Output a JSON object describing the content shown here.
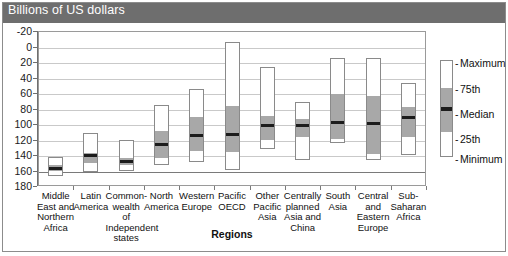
{
  "header": {
    "title": "Billions of US dollars"
  },
  "axis": {
    "y_ticks": [
      "180",
      "160",
      "140",
      "120",
      "100",
      "80",
      "60",
      "40",
      "20",
      "0",
      "-20"
    ],
    "x_title": "Regions"
  },
  "legend": {
    "items": [
      {
        "label": "Maximum",
        "dash": "-"
      },
      {
        "label": "75th",
        "dash": "-"
      },
      {
        "label": "Median",
        "dash": "-"
      },
      {
        "label": "25th",
        "dash": "-"
      },
      {
        "label": "Minimum",
        "dash": "-"
      }
    ]
  },
  "colors": {
    "title_band": "#6e6e6e",
    "iqr_fill": "#a8a8a8",
    "median": "#1c1c1c",
    "bar_outline": "#8a8a8a",
    "gridline": "#c9c9c9",
    "frame": "#8c8c8c"
  },
  "chart_data": {
    "type": "bar",
    "title": "Billions of US dollars",
    "xlabel": "Regions",
    "ylabel": "Billions of US dollars",
    "ylim": [
      -20,
      180
    ],
    "yticks": [
      -20,
      0,
      20,
      40,
      60,
      80,
      100,
      120,
      140,
      160,
      180
    ],
    "grid": true,
    "legend_position": "right",
    "categories": [
      "Middle East and Northern Africa",
      "Latin America",
      "Common-wealth of Independent states",
      "North America",
      "Western Europe",
      "Pacific OECD",
      "Other Pacific Asia",
      "Centrally planned Asia and China",
      "South Asia",
      "Central and Eastern Europe",
      "Sub-Saharan Africa"
    ],
    "category_lines": [
      [
        "Middle",
        "East and",
        "Northern",
        "Africa"
      ],
      [
        "Latin",
        "America"
      ],
      [
        "Common-",
        "wealth",
        "of",
        "Independent",
        "states"
      ],
      [
        "North",
        "America"
      ],
      [
        "Western",
        "Europe"
      ],
      [
        "Pacific",
        "OECD"
      ],
      [
        "Other",
        "Pacific",
        "Asia"
      ],
      [
        "Centrally",
        "planned",
        "Asia and",
        "China"
      ],
      [
        "South",
        "Asia"
      ],
      [
        "Central",
        "and",
        "Eastern",
        "Europe"
      ],
      [
        "Sub-",
        "Saharan",
        "Africa"
      ]
    ],
    "series": [
      {
        "name": "Minimum",
        "values": [
          -7,
          -2,
          -1,
          7,
          11,
          0,
          28,
          13,
          35,
          13,
          20
        ]
      },
      {
        "name": "25th",
        "values": [
          0,
          11,
          8,
          18,
          27,
          25,
          40,
          45,
          42,
          22,
          45
        ]
      },
      {
        "name": "Median",
        "values": [
          4,
          21,
          13,
          35,
          47,
          48,
          59,
          59,
          63,
          62,
          70
        ]
      },
      {
        "name": "75th",
        "values": [
          9,
          24,
          17,
          52,
          70,
          85,
          72,
          68,
          100,
          97,
          83
        ]
      },
      {
        "name": "Maximum",
        "values": [
          17,
          49,
          40,
          84,
          105,
          166,
          133,
          89,
          145,
          145,
          113
        ]
      }
    ]
  }
}
